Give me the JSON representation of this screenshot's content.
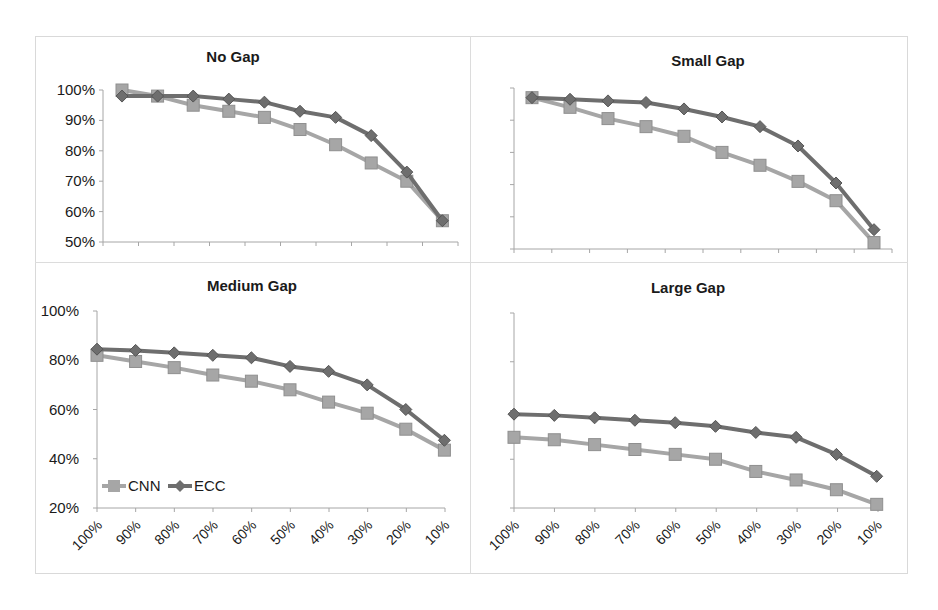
{
  "figure": {
    "legend": [
      {
        "name": "CNN",
        "color": "#a6a6a6",
        "marker": "square"
      },
      {
        "name": "ECC",
        "color": "#6e6e6e",
        "marker": "diamond"
      }
    ]
  },
  "chart_data": [
    {
      "type": "line",
      "title": "No Gap",
      "categories": [
        "100%",
        "90%",
        "80%",
        "70%",
        "60%",
        "50%",
        "40%",
        "30%",
        "20%",
        "10%"
      ],
      "yticks": [
        "50%",
        "60%",
        "70%",
        "80%",
        "90%",
        "100%"
      ],
      "ylim": [
        50,
        100
      ],
      "show_yticks": true,
      "show_xticks": false,
      "grid": false,
      "series": [
        {
          "name": "CNN",
          "values": [
            100,
            98,
            95,
            93,
            91,
            87,
            82,
            76,
            70,
            57
          ]
        },
        {
          "name": "ECC",
          "values": [
            98,
            98,
            98,
            97,
            96,
            93,
            91,
            85,
            73,
            57
          ]
        }
      ]
    },
    {
      "type": "line",
      "title": "Small Gap",
      "categories": [
        "100%",
        "90%",
        "80%",
        "70%",
        "60%",
        "50%",
        "40%",
        "30%",
        "20%",
        "10%"
      ],
      "yticks": [
        "50%",
        "60%",
        "70%",
        "80%",
        "90%",
        "100%"
      ],
      "ylim": [
        50,
        100
      ],
      "show_yticks": false,
      "show_xticks": false,
      "grid": false,
      "series": [
        {
          "name": "CNN",
          "values": [
            97,
            94,
            90.5,
            88,
            85,
            80,
            76,
            71,
            65,
            52
          ]
        },
        {
          "name": "ECC",
          "values": [
            97,
            96.5,
            96,
            95.5,
            93.5,
            91,
            88,
            82,
            70.5,
            56
          ]
        }
      ]
    },
    {
      "type": "line",
      "title": "Medium Gap",
      "categories": [
        "100%",
        "90%",
        "80%",
        "70%",
        "60%",
        "50%",
        "40%",
        "30%",
        "20%",
        "10%"
      ],
      "yticks": [
        "20%",
        "40%",
        "60%",
        "80%",
        "100%"
      ],
      "ylim": [
        20,
        100
      ],
      "show_yticks": true,
      "show_xticks": true,
      "show_legend": true,
      "legend_position": "lower-left",
      "grid": false,
      "series": [
        {
          "name": "CNN",
          "values": [
            82,
            79.5,
            77,
            74,
            71.5,
            68,
            63,
            58.5,
            52,
            43.5
          ]
        },
        {
          "name": "ECC",
          "values": [
            84.5,
            84,
            83,
            82,
            81,
            77.5,
            75.5,
            70,
            60,
            47.5
          ]
        }
      ]
    },
    {
      "type": "line",
      "title": "Large Gap",
      "categories": [
        "100%",
        "90%",
        "80%",
        "70%",
        "60%",
        "50%",
        "40%",
        "30%",
        "20%",
        "10%"
      ],
      "yticks": [
        "20%",
        "40%",
        "60%",
        "80%",
        "100%"
      ],
      "ylim": [
        20,
        100
      ],
      "show_yticks": false,
      "show_xticks": true,
      "grid": false,
      "series": [
        {
          "name": "CNN",
          "values": [
            49,
            48,
            46,
            44,
            42,
            40,
            35,
            31.5,
            27.5,
            21.5
          ]
        },
        {
          "name": "ECC",
          "values": [
            58.5,
            58,
            57,
            56,
            55,
            53.5,
            51,
            49,
            42,
            33
          ]
        }
      ]
    }
  ]
}
